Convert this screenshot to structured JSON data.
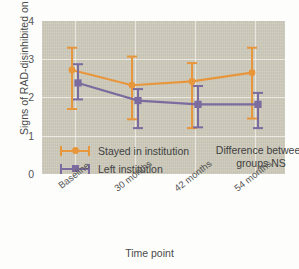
{
  "chart_data": {
    "type": "line",
    "title": "",
    "xlabel": "Time point",
    "ylabel": "Signs of RAD-disinhibited on DAI",
    "categories": [
      "Baseline",
      "30 months",
      "42 months",
      "54 months"
    ],
    "ylim": [
      0,
      4
    ],
    "yticks": [
      "0",
      "1",
      "2",
      "3",
      "4"
    ],
    "grid": true,
    "legend_position": "inside-lower-left",
    "annotation": {
      "line1": "Difference between",
      "line2": "groups NS"
    },
    "series": [
      {
        "name": "Stayed in institution",
        "color": "#e8963c",
        "marker": "circle",
        "values": [
          2.72,
          2.32,
          2.42,
          2.65
        ],
        "error_low": [
          1.7,
          1.43,
          1.2,
          1.45
        ],
        "error_high": [
          3.3,
          3.07,
          2.9,
          3.3
        ]
      },
      {
        "name": "Left institution",
        "color": "#7b6b9e",
        "marker": "square",
        "values": [
          2.38,
          1.92,
          1.82,
          1.82
        ],
        "error_low": [
          1.95,
          1.2,
          1.22,
          1.2
        ],
        "error_high": [
          2.87,
          2.22,
          2.3,
          2.12
        ]
      }
    ]
  },
  "legend": {
    "items": [
      {
        "label": "Stayed in institution",
        "color": "#e8963c",
        "marker": "circle"
      },
      {
        "label": "Left institution",
        "color": "#7b6b9e",
        "marker": "square"
      }
    ]
  },
  "colors": {
    "orange": "#e8963c",
    "purple": "#7b6b9e",
    "plot_background": "#cdcabb",
    "gridline": "#f0efe8"
  }
}
